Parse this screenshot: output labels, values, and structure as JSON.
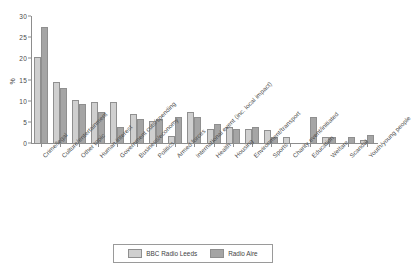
{
  "chart_data": {
    "type": "bar",
    "title": "",
    "subtitle": "",
    "xlabel": "",
    "ylabel": "%",
    "ylim": [
      0,
      30
    ],
    "yticks": [
      0,
      5,
      10,
      15,
      20,
      25,
      30
    ],
    "grid": false,
    "legend_position": "bottom",
    "categories": [
      "Crime/legal",
      "Culture/entertainment",
      "Other topic",
      "Human interest",
      "Government cuts/spending",
      "Business/economy",
      "Politics",
      "Armed forces",
      "International event (inc. local impact)",
      "Health",
      "Housing",
      "Environment/transport",
      "Sports",
      "Charity event/initiated",
      "Education",
      "Welfare",
      "Scandal",
      "Youth/young people"
    ],
    "series": [
      {
        "name": "BBC Radio Leeds",
        "color": "#cfcfcf",
        "values": [
          20.3,
          14.4,
          10.2,
          9.6,
          9.6,
          6.9,
          5.2,
          1.7,
          7.4,
          3.3,
          3.9,
          3.4,
          3.0,
          1.5,
          0.0,
          1.5,
          0.0,
          0.8
        ]
      },
      {
        "name": "Radio Aire",
        "color": "#a5a5a5",
        "values": [
          27.4,
          12.9,
          9.2,
          7.4,
          3.7,
          5.6,
          5.6,
          6.2,
          6.1,
          4.4,
          3.3,
          3.9,
          1.5,
          0.0,
          6.1,
          1.5,
          1.5,
          1.9
        ]
      }
    ]
  },
  "legend": {
    "items": [
      {
        "label": "BBC Radio Leeds",
        "swatch": "s0"
      },
      {
        "label": "Radio Aire",
        "swatch": "s1"
      }
    ]
  }
}
